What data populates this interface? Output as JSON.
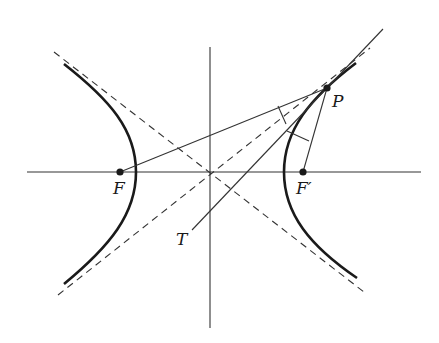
{
  "figure": {
    "labels": {
      "focus_left": "F",
      "focus_right": "F′",
      "point": "P",
      "tangent": "T"
    },
    "colors": {
      "ink": "#1a1a1a",
      "background": "#ffffff"
    },
    "geometry": {
      "center": [
        210,
        172
      ],
      "semi_major_a": 74,
      "semi_minor_b": 57,
      "focus_left": [
        120,
        172
      ],
      "focus_right": [
        303,
        172
      ],
      "point_P": [
        327,
        88
      ],
      "tangent_end_T": [
        192,
        230
      ]
    }
  }
}
